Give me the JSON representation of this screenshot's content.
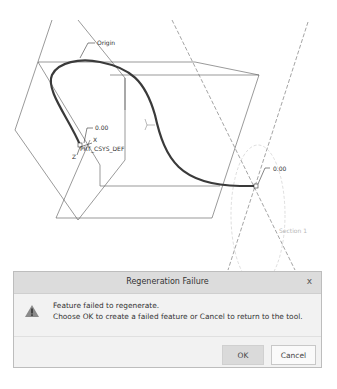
{
  "viewport": {
    "annotations": {
      "origin": "Origin",
      "dim_left": "0.00",
      "csys": "PRT_CSYS_DEF",
      "axis_x": "X",
      "axis_z": "Z",
      "dim_right": "0.00",
      "section": "Section 1"
    },
    "colors": {
      "curve": "#3a3a3a",
      "datum": "#555555",
      "dashed": "#666666",
      "faint": "#c0c0c0"
    }
  },
  "dialog": {
    "title": "Regeneration Failure",
    "close_label": "x",
    "icon": "warning-icon",
    "message_line1": "Feature failed to regenerate.",
    "message_line2": "Choose OK to create a failed feature or Cancel to return to the tool.",
    "ok_label": "OK",
    "cancel_label": "Cancel"
  }
}
